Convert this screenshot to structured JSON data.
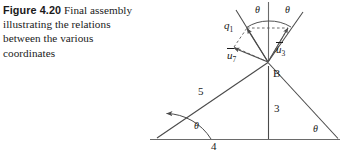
{
  "caption": {
    "figure_number": "Figure 4.20",
    "text": "Final assembly illustrating the relations between the various coordinates"
  },
  "figure": {
    "labels": {
      "theta_top_left": "θ",
      "theta_top_right": "θ",
      "theta_bottom_left": "θ",
      "theta_bottom_right": "θ",
      "q1_symbol": "q",
      "q1_sub": "1",
      "u7_symbol": "u",
      "u7_sub": "7",
      "u3_symbol": "u",
      "u3_sub": "3",
      "side_left": "5",
      "side_vertical": "3",
      "side_base": "4",
      "vertex_b": "B"
    },
    "colors": {
      "stroke": "#4a4a4a",
      "text": "#1a1a1a",
      "background": "#ffffff"
    }
  }
}
